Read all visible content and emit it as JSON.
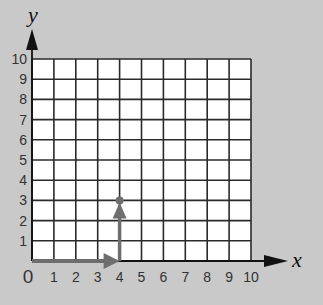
{
  "diagram": {
    "type": "coordinate-grid",
    "x_axis": {
      "label": "x",
      "ticks": [
        "1",
        "2",
        "3",
        "4",
        "5",
        "6",
        "7",
        "8",
        "9",
        "10"
      ]
    },
    "y_axis": {
      "label": "y",
      "ticks": [
        "1",
        "2",
        "3",
        "4",
        "5",
        "6",
        "7",
        "8",
        "9",
        "10"
      ]
    },
    "origin_label": "0",
    "grid": {
      "x_min": 0,
      "x_max": 10,
      "y_min": 0,
      "y_max": 10
    },
    "path": [
      {
        "from": [
          0,
          0
        ],
        "to": [
          4,
          0
        ],
        "direction": "right"
      },
      {
        "from": [
          4,
          0
        ],
        "to": [
          4,
          3
        ],
        "direction": "up"
      }
    ],
    "point": {
      "x": 4,
      "y": 3
    },
    "colors": {
      "background": "#c9c9c9",
      "grid_fill": "#ffffff",
      "grid_lines": "#2a2a2a",
      "path_arrow": "#6e6e6e",
      "axis_arrow": "#111111"
    }
  }
}
